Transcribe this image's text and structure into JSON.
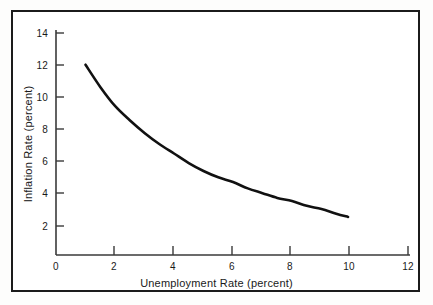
{
  "figure": {
    "name": "phillips-curve-figure",
    "frame_color": "#1b1b1b",
    "background_color": "#ffffff",
    "curve_color": "#111111",
    "axis_color": "#3a3a3a"
  },
  "chart_data": {
    "type": "line",
    "title": "",
    "xlabel": "Unemployment Rate (percent)",
    "ylabel": "Inflation Rate (percent)",
    "xlim": [
      0,
      12
    ],
    "ylim": [
      0,
      14
    ],
    "xticks": [
      0,
      2,
      4,
      6,
      8,
      10,
      12
    ],
    "xtick_labels": [
      "0",
      "2",
      "4",
      "6",
      "8",
      "10",
      "12"
    ],
    "yticks": [
      2,
      4,
      6,
      8,
      10,
      12,
      14
    ],
    "ytick_labels": [
      "2",
      "4",
      "6",
      "8",
      "10",
      "12",
      "14"
    ],
    "grid": false,
    "legend": null,
    "series": [
      {
        "name": "Phillips curve",
        "x": [
          1.0,
          1.5,
          2.0,
          2.5,
          3.0,
          3.5,
          4.0,
          4.5,
          5.0,
          5.5,
          6.0,
          6.5,
          7.0,
          7.5,
          8.0,
          8.5,
          9.0,
          9.5,
          9.9
        ],
        "y": [
          12.0,
          10.6,
          9.4,
          8.5,
          7.7,
          7.0,
          6.4,
          5.8,
          5.3,
          4.9,
          4.6,
          4.2,
          3.9,
          3.6,
          3.4,
          3.1,
          2.9,
          2.6,
          2.4
        ]
      }
    ]
  }
}
